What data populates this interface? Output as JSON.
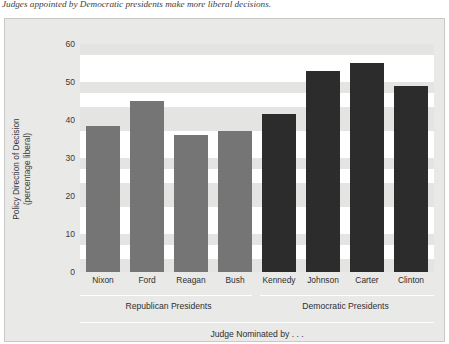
{
  "caption": "Judges appointed by Democratic presidents make more liberal decisions.",
  "chart_data": {
    "type": "bar",
    "title": "",
    "xlabel": "Judge Nominated by . . .",
    "ylabel": "Policy Direction of Decision (percentage liberal)",
    "ylabel_line1": "Policy Direction of Decision",
    "ylabel_line2": "(percentage liberal)",
    "categories": [
      "Nixon",
      "Ford",
      "Reagan",
      "Bush",
      "Kennedy",
      "Johnson",
      "Carter",
      "Clinton"
    ],
    "values": [
      38.5,
      45,
      36,
      37,
      41.5,
      53,
      55,
      49
    ],
    "ylim": [
      0,
      60
    ],
    "yticks": [
      0,
      10,
      20,
      30,
      40,
      50,
      60
    ],
    "ytick_labels": [
      "0",
      "10",
      "20",
      "30",
      "40",
      "50",
      "60"
    ],
    "grid": true,
    "legend": "none",
    "groups": [
      {
        "label": "Republican Presidents",
        "members": [
          "Nixon",
          "Ford",
          "Reagan",
          "Bush"
        ],
        "color": "#757575"
      },
      {
        "label": "Democratic Presidents",
        "members": [
          "Kennedy",
          "Johnson",
          "Carter",
          "Clinton"
        ],
        "color": "#2c2c2c"
      }
    ],
    "colors": {
      "republican_bar": "#757575",
      "democratic_bar": "#2c2c2c",
      "panel_background": "#e9e9e7",
      "plot_background": "#ffffff",
      "gridband": "#e4e4e2"
    }
  }
}
